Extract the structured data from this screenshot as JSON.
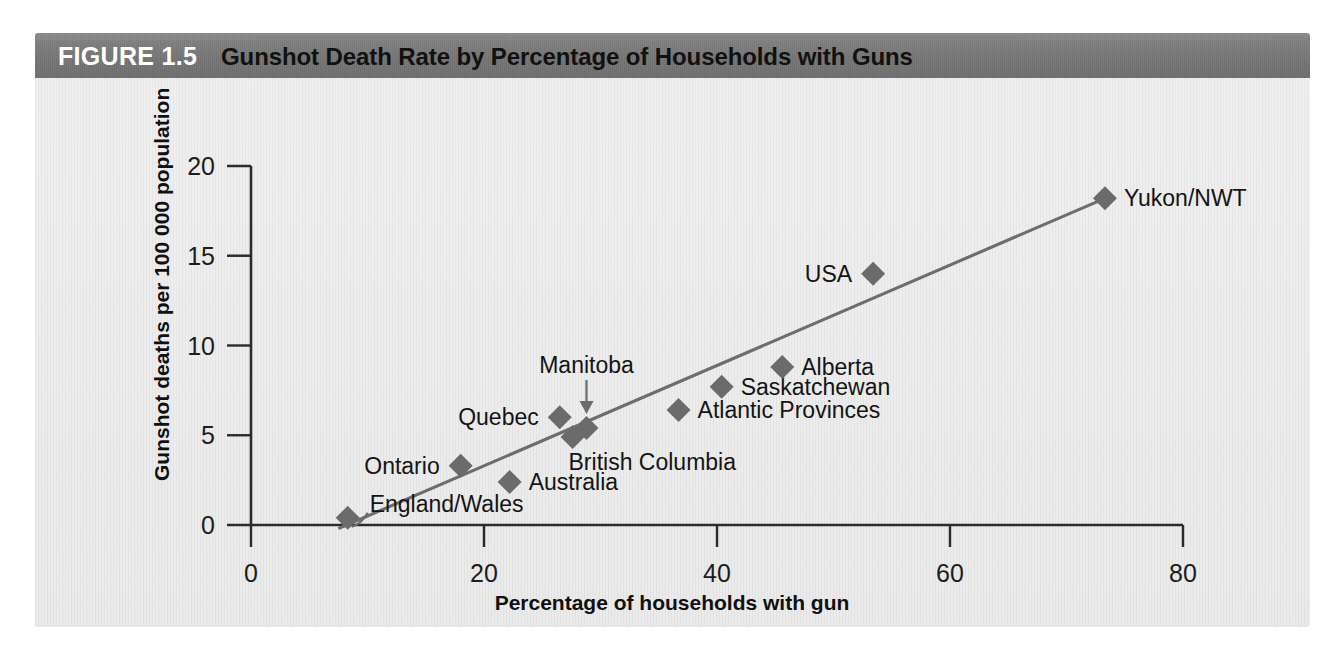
{
  "figure": {
    "number_label": "FIGURE 1.5",
    "title": "Gunshot Death Rate by Percentage of Households with Guns",
    "header_color": "#797979",
    "body_color": "#e9e9e9"
  },
  "chart_data": {
    "type": "scatter",
    "title": "Gunshot Death Rate by Percentage of Households with Guns",
    "xlabel": "Percentage of households with gun",
    "ylabel": "Gunshot deaths per 100 000 population",
    "xlim": [
      0,
      80
    ],
    "ylim": [
      0,
      20
    ],
    "xticks": [
      0,
      20,
      40,
      60,
      80
    ],
    "yticks": [
      0,
      5,
      10,
      15,
      20
    ],
    "xtick_labels": [
      "0",
      "20",
      "40",
      "60",
      "80"
    ],
    "ytick_labels": [
      "0",
      "5",
      "10",
      "15",
      "20"
    ],
    "grid": false,
    "legend": null,
    "marker_shape": "diamond",
    "marker_color": "#6b6b6b",
    "trend_line": {
      "color": "#6d6d6d",
      "x_start": 7.5,
      "y_start": -0.2,
      "x_end": 73.3,
      "y_end": 18.2
    },
    "points": [
      {
        "label": "England/Wales",
        "x": 8.3,
        "y": 0.4,
        "label_side": "right",
        "leader": true
      },
      {
        "label": "Ontario",
        "x": 18.0,
        "y": 3.3,
        "label_side": "left",
        "leader": false
      },
      {
        "label": "Australia",
        "x": 22.2,
        "y": 2.4,
        "label_side": "right",
        "leader": false
      },
      {
        "label": "Quebec",
        "x": 26.5,
        "y": 6.0,
        "label_side": "left",
        "leader": false
      },
      {
        "label": "British Columbia",
        "x": 27.6,
        "y": 4.9,
        "label_side": "below",
        "leader": false
      },
      {
        "label": "Manitoba",
        "x": 28.8,
        "y": 5.4,
        "label_side": "above-arrow",
        "leader": false
      },
      {
        "label": "Atlantic Provinces",
        "x": 36.7,
        "y": 6.4,
        "label_side": "right",
        "leader": false
      },
      {
        "label": "Saskatchewan",
        "x": 40.4,
        "y": 7.7,
        "label_side": "right",
        "leader": false
      },
      {
        "label": "Alberta",
        "x": 45.6,
        "y": 8.8,
        "label_side": "right",
        "leader": false
      },
      {
        "label": "USA",
        "x": 53.4,
        "y": 14.0,
        "label_side": "left",
        "leader": false
      },
      {
        "label": "Yukon/NWT",
        "x": 73.3,
        "y": 18.2,
        "label_side": "right",
        "leader": false
      }
    ]
  }
}
